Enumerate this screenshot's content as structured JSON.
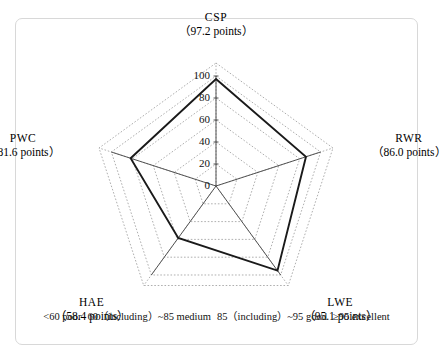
{
  "figure": {
    "frame_color": "#d8d8d8",
    "background": "#ffffff"
  },
  "chart_data": {
    "type": "radar",
    "title": "",
    "categories": [
      "CSP",
      "RWR",
      "LWE",
      "HAE",
      "PWC"
    ],
    "values": [
      97.2,
      86.0,
      95.1,
      58.4,
      81.6
    ],
    "value_unit": "points",
    "axis_labels": [
      {
        "name": "CSP",
        "value": "（97.2 points）",
        "raw": 97.2
      },
      {
        "name": "RWR",
        "value": "（86.0 points）",
        "raw": 86.0
      },
      {
        "name": "LWE",
        "value": "（95.1 points）",
        "raw": 95.1
      },
      {
        "name": "HAE",
        "value": "（58.4 points）",
        "raw": 58.4
      },
      {
        "name": "PWC",
        "value": "（81.6 points）",
        "raw": 81.6
      }
    ],
    "rlim": [
      0,
      100
    ],
    "rticks": [
      0,
      20,
      40,
      60,
      80,
      100
    ],
    "rtick_labels": [
      "0",
      "20",
      "40",
      "60",
      "80",
      "100"
    ],
    "grid": true,
    "grid_style": "dotted",
    "grid_color": "#9b9b9b",
    "series_color": "#1a1a1a",
    "series_fill": "none",
    "legend_position": "bottom",
    "start_angle_deg": 90,
    "direction": "clockwise"
  },
  "legend": {
    "items": [
      "<60 poor",
      "60（including）~85 medium",
      "85（including）~95 good",
      "≥95 excellent"
    ],
    "full_text": "<60 poor  60（including）~85 medium  85（including）~95 good  ≥95 excellent"
  }
}
